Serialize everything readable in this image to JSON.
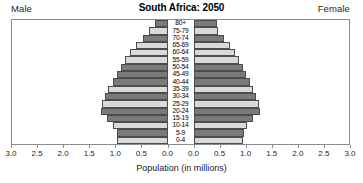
{
  "header": {
    "title": "South Africa: 2050",
    "male_label": "Male",
    "female_label": "Female"
  },
  "axis": {
    "title": "Population (in millions)",
    "tick_labels": [
      "3.0",
      "2.5",
      "2.0",
      "1.5",
      "1.0",
      "0.5",
      "0.0",
      "0.0",
      "0.5",
      "1.0",
      "1.5",
      "2.0",
      "2.5",
      "3.0"
    ],
    "max": 3.0,
    "step": 0.5
  },
  "colors": {
    "bar_light": "#d9d9d9",
    "bar_dark": "#7a7a7a",
    "bar_outline": "#4d4d4d",
    "frame": "#8c8c8c",
    "text": "#1a1a1a"
  },
  "chart_data": {
    "type": "bar",
    "subtype": "population-pyramid",
    "title": "South Africa: 2050",
    "xlabel": "Population (in millions)",
    "ylabel": "",
    "xlim": [
      0,
      3.0
    ],
    "grid": false,
    "legend": [
      "Male",
      "Female"
    ],
    "legend_position": "top-left-and-top-right",
    "categories": [
      "0-4",
      "5-9",
      "10-14",
      "15-19",
      "20-24",
      "25-29",
      "30-34",
      "35-39",
      "40-44",
      "45-49",
      "50-54",
      "55-59",
      "60-64",
      "65-69",
      "70-74",
      "75-79",
      "80+"
    ],
    "series": [
      {
        "name": "Male",
        "side": "left",
        "values": [
          0.97,
          0.98,
          1.05,
          1.16,
          1.28,
          1.27,
          1.21,
          1.14,
          1.06,
          0.97,
          0.9,
          0.82,
          0.72,
          0.61,
          0.48,
          0.36,
          0.25
        ]
      },
      {
        "name": "Female",
        "side": "right",
        "values": [
          0.96,
          0.97,
          1.04,
          1.15,
          1.28,
          1.26,
          1.21,
          1.15,
          1.09,
          1.01,
          0.95,
          0.88,
          0.8,
          0.7,
          0.58,
          0.48,
          0.45
        ]
      }
    ],
    "bar_shades": [
      "light",
      "dark",
      "light",
      "dark",
      "dark",
      "light",
      "dark",
      "light",
      "dark",
      "dark",
      "dark",
      "light",
      "light",
      "light",
      "dark",
      "light",
      "dark"
    ]
  }
}
